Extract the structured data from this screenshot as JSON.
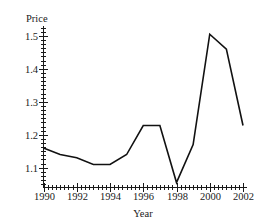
{
  "chart_data": {
    "type": "line",
    "title": "",
    "xlabel": "Year",
    "ylabel": "Price",
    "x": [
      1990,
      1991,
      1992,
      1993,
      1994,
      1995,
      1996,
      1997,
      1998,
      1999,
      2000,
      2001,
      2002
    ],
    "values": [
      1.16,
      1.14,
      1.13,
      1.11,
      1.11,
      1.14,
      1.228,
      1.228,
      1.055,
      1.17,
      1.505,
      1.46,
      1.228
    ],
    "series": [
      {
        "name": "Price",
        "values": [
          1.16,
          1.14,
          1.13,
          1.11,
          1.11,
          1.14,
          1.228,
          1.228,
          1.055,
          1.17,
          1.505,
          1.46,
          1.228
        ]
      }
    ],
    "xlim": [
      1990,
      2002
    ],
    "ylim": [
      1.04,
      1.53
    ],
    "xticks": [
      1990,
      1992,
      1994,
      1996,
      1998,
      2000,
      2002
    ],
    "xtick_labels": [
      "1990",
      "1992",
      "1994",
      "1996",
      "1998",
      "2000",
      "2002"
    ],
    "yticks": [
      1.1,
      1.2,
      1.3,
      1.4,
      1.5
    ],
    "ytick_labels": [
      "1.1",
      "1.2",
      "1.3",
      "1.4",
      "1.5"
    ],
    "x_minor_step": 0.25,
    "y_minor_step": 0.0125,
    "grid": false,
    "legend": false,
    "legend_position": "none",
    "line_color": "#111111",
    "axis_color": "#1a1a1a",
    "background": "#ffffff"
  },
  "labels": {
    "y_axis_title": "Price",
    "x_axis_title": "Year",
    "ytick_0": "1.1",
    "ytick_1": "1.2",
    "ytick_2": "1.3",
    "ytick_3": "1.4",
    "ytick_4": "1.5",
    "xtick_0": "1990",
    "xtick_1": "1992",
    "xtick_2": "1994",
    "xtick_3": "1996",
    "xtick_4": "1998",
    "xtick_5": "2000",
    "xtick_6": "2002"
  }
}
